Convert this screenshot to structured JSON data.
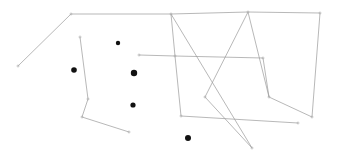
{
  "figure": {
    "title": "",
    "width": 340,
    "height": 158,
    "background_color": "#ffffff",
    "line_color": "#9a9a9a",
    "vertex_color": "#b0b0b0",
    "dot_color": "#111111",
    "line_width": 0.7,
    "vertex_size": 3
  },
  "chart_data": {
    "type": "scatter",
    "title": "",
    "xlabel": "",
    "ylabel": "",
    "xlim": [
      0,
      340
    ],
    "ylim": [
      0,
      158
    ],
    "grid": false,
    "legend": null,
    "polylines": [
      {
        "name": "left-upper-chain",
        "points": [
          [
            18,
            66
          ],
          [
            71,
            14
          ],
          [
            171,
            14
          ],
          [
            248,
            12
          ],
          [
            320,
            13
          ]
        ]
      },
      {
        "name": "left-vertical-chain",
        "points": [
          [
            80,
            37
          ],
          [
            88,
            99
          ],
          [
            82,
            117
          ],
          [
            129,
            132
          ]
        ]
      },
      {
        "name": "mid-upper-fan",
        "points": [
          [
            171,
            14
          ],
          [
            175,
            56
          ],
          [
            263,
            58
          ]
        ]
      },
      {
        "name": "mid-descender",
        "points": [
          [
            171,
            14
          ],
          [
            252,
            148
          ]
        ]
      },
      {
        "name": "left-inner-brace",
        "points": [
          [
            139,
            55
          ],
          [
            175,
            56
          ],
          [
            181,
            116
          ],
          [
            298,
            123
          ]
        ]
      },
      {
        "name": "peak-left-leg",
        "points": [
          [
            248,
            12
          ],
          [
            205,
            97
          ],
          [
            252,
            148
          ]
        ]
      },
      {
        "name": "peak-right-leg",
        "points": [
          [
            248,
            12
          ],
          [
            269,
            97
          ],
          [
            263,
            58
          ]
        ]
      },
      {
        "name": "right-descender",
        "points": [
          [
            320,
            13
          ],
          [
            312,
            117
          ]
        ]
      },
      {
        "name": "right-lower-hook",
        "points": [
          [
            269,
            97
          ],
          [
            312,
            117
          ]
        ]
      }
    ],
    "vertices": [
      {
        "name": "v-left-end",
        "x": 18,
        "y": 66
      },
      {
        "name": "v-top-left",
        "x": 71,
        "y": 14
      },
      {
        "name": "v-top-mid-left",
        "x": 171,
        "y": 14
      },
      {
        "name": "v-top-mid-right",
        "x": 248,
        "y": 12
      },
      {
        "name": "v-top-right",
        "x": 320,
        "y": 13
      },
      {
        "name": "v-brace-left",
        "x": 139,
        "y": 55
      },
      {
        "name": "v-junction-mid",
        "x": 175,
        "y": 56
      },
      {
        "name": "v-chain-top",
        "x": 80,
        "y": 37
      },
      {
        "name": "v-chain-knee",
        "x": 88,
        "y": 99
      },
      {
        "name": "v-chain-corner",
        "x": 82,
        "y": 117
      },
      {
        "name": "v-chain-end",
        "x": 129,
        "y": 132
      },
      {
        "name": "v-brace-corner",
        "x": 181,
        "y": 116
      },
      {
        "name": "v-brace-right",
        "x": 298,
        "y": 123
      },
      {
        "name": "v-peak-apex",
        "x": 252,
        "y": 148
      },
      {
        "name": "v-right-bottom",
        "x": 312,
        "y": 117
      },
      {
        "name": "v-right-hook",
        "x": 269,
        "y": 97
      },
      {
        "name": "v-left-valley",
        "x": 205,
        "y": 97
      },
      {
        "name": "v-mid-right-node",
        "x": 263,
        "y": 58
      }
    ],
    "points": [
      {
        "name": "dot-1",
        "x": 118,
        "y": 43,
        "r": 2.2
      },
      {
        "name": "dot-2",
        "x": 74,
        "y": 70,
        "r": 2.8
      },
      {
        "name": "dot-3",
        "x": 134,
        "y": 73,
        "r": 3.2
      },
      {
        "name": "dot-4",
        "x": 133,
        "y": 105,
        "r": 2.6
      },
      {
        "name": "dot-5",
        "x": 188,
        "y": 138,
        "r": 3.0
      }
    ]
  }
}
